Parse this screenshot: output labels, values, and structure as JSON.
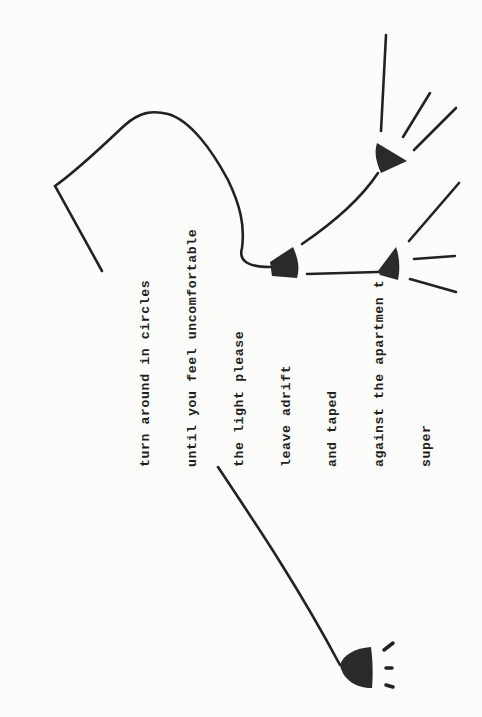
{
  "poem": {
    "lines": [
      "turn around in circles",
      "until you feel uncomfortable",
      "the light please",
      "leave adrift",
      "and taped",
      "against the apartmen t",
      "super"
    ]
  },
  "drawing": {
    "stroke_color": "#222222",
    "fill_color": "#2a2a2a",
    "elements": [
      "loop-line",
      "lamp-left-center",
      "lamp-upper-right",
      "lamp-lower-right",
      "lamp-bottom",
      "ray-lines"
    ]
  }
}
